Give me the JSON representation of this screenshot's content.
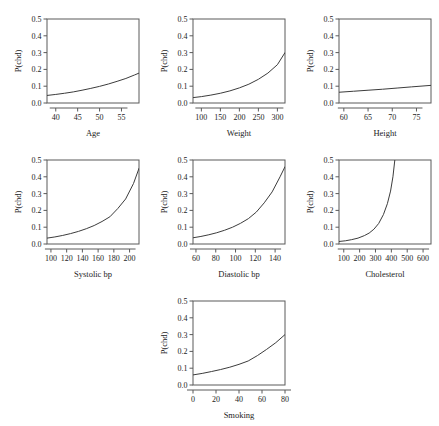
{
  "figure": {
    "background": "#ffffff",
    "line_color": "#3c3c3c",
    "axis_color": "#5a5a5a",
    "ylabel": "P(chd)",
    "yticks": [
      "0.0",
      "0.1",
      "0.2",
      "0.3",
      "0.4",
      "0.5"
    ],
    "ylim": [
      0.0,
      0.5
    ]
  },
  "chart_data": [
    {
      "type": "line",
      "title": "",
      "xlabel": "Age",
      "ylabel": "P(chd)",
      "xlim": [
        38,
        59
      ],
      "ylim": [
        0.0,
        0.5
      ],
      "grid": false,
      "legend": "none",
      "xticks": [
        40,
        45,
        50,
        55
      ],
      "yticks": [
        0.0,
        0.1,
        0.2,
        0.3,
        0.4,
        0.5
      ],
      "x": [
        38,
        40,
        42,
        44,
        46,
        48,
        50,
        52,
        54,
        56,
        58,
        59
      ],
      "y": [
        0.045,
        0.051,
        0.058,
        0.066,
        0.076,
        0.087,
        0.099,
        0.113,
        0.129,
        0.146,
        0.167,
        0.178
      ]
    },
    {
      "type": "line",
      "title": "",
      "xlabel": "Weight",
      "ylabel": "P(chd)",
      "xlim": [
        78,
        320
      ],
      "ylim": [
        0.0,
        0.5
      ],
      "grid": false,
      "legend": "none",
      "xticks": [
        100,
        150,
        200,
        250,
        300
      ],
      "yticks": [
        0.0,
        0.1,
        0.2,
        0.3,
        0.4,
        0.5
      ],
      "x": [
        78,
        100,
        125,
        150,
        175,
        200,
        225,
        250,
        275,
        300,
        320
      ],
      "y": [
        0.032,
        0.038,
        0.047,
        0.058,
        0.072,
        0.09,
        0.112,
        0.141,
        0.178,
        0.228,
        0.3
      ]
    },
    {
      "type": "line",
      "title": "",
      "xlabel": "Height",
      "ylabel": "P(chd)",
      "xlim": [
        59,
        78
      ],
      "ylim": [
        0.0,
        0.5
      ],
      "grid": false,
      "legend": "none",
      "xticks": [
        60,
        65,
        70,
        75
      ],
      "yticks": [
        0.0,
        0.1,
        0.2,
        0.3,
        0.4,
        0.5
      ],
      "x": [
        59,
        62,
        65,
        68,
        71,
        74,
        78
      ],
      "y": [
        0.064,
        0.07,
        0.076,
        0.082,
        0.089,
        0.096,
        0.105
      ]
    },
    {
      "type": "line",
      "title": "",
      "xlabel": "Systolic bp",
      "ylabel": "P(chd)",
      "xlim": [
        95,
        212
      ],
      "ylim": [
        0.0,
        0.5
      ],
      "grid": false,
      "legend": "none",
      "xticks": [
        100,
        120,
        140,
        160,
        180,
        200
      ],
      "yticks": [
        0.0,
        0.1,
        0.2,
        0.3,
        0.4,
        0.5
      ],
      "x": [
        95,
        105,
        115,
        125,
        135,
        145,
        155,
        165,
        175,
        185,
        195,
        205,
        212
      ],
      "y": [
        0.035,
        0.042,
        0.051,
        0.062,
        0.075,
        0.091,
        0.11,
        0.134,
        0.162,
        0.211,
        0.268,
        0.36,
        0.45
      ]
    },
    {
      "type": "line",
      "title": "",
      "xlabel": "Diastolic bp",
      "ylabel": "P(chd)",
      "xlim": [
        57,
        150
      ],
      "ylim": [
        0.0,
        0.5
      ],
      "grid": false,
      "legend": "none",
      "xticks": [
        60,
        80,
        100,
        120,
        140
      ],
      "yticks": [
        0.0,
        0.1,
        0.2,
        0.3,
        0.4,
        0.5
      ],
      "x": [
        57,
        65,
        73,
        81,
        89,
        97,
        105,
        113,
        121,
        129,
        137,
        145,
        150
      ],
      "y": [
        0.037,
        0.045,
        0.055,
        0.067,
        0.082,
        0.1,
        0.123,
        0.151,
        0.19,
        0.245,
        0.31,
        0.4,
        0.46
      ]
    },
    {
      "type": "line",
      "title": "",
      "xlabel": "Cholesterol",
      "ylabel": "P(chd)",
      "xlim": [
        70,
        650
      ],
      "ylim": [
        0.0,
        0.5
      ],
      "grid": false,
      "legend": "none",
      "xticks": [
        100,
        200,
        300,
        400,
        500,
        600
      ],
      "yticks": [
        0.0,
        0.1,
        0.2,
        0.3,
        0.4,
        0.5
      ],
      "x": [
        70,
        110,
        150,
        190,
        230,
        260,
        290,
        320,
        350,
        375,
        395,
        410,
        422
      ],
      "y": [
        0.015,
        0.019,
        0.026,
        0.035,
        0.05,
        0.065,
        0.088,
        0.122,
        0.175,
        0.24,
        0.315,
        0.4,
        0.5
      ]
    },
    {
      "type": "line",
      "title": "",
      "xlabel": "Smoking",
      "ylabel": "P(chd)",
      "xlim": [
        0,
        80
      ],
      "ylim": [
        0.0,
        0.5
      ],
      "grid": false,
      "legend": "none",
      "xticks": [
        0,
        20,
        40,
        60,
        80
      ],
      "yticks": [
        0.0,
        0.1,
        0.2,
        0.3,
        0.4,
        0.5
      ],
      "x": [
        0,
        8,
        16,
        24,
        32,
        40,
        48,
        56,
        64,
        72,
        80
      ],
      "y": [
        0.06,
        0.069,
        0.08,
        0.092,
        0.106,
        0.123,
        0.143,
        0.175,
        0.212,
        0.252,
        0.3
      ]
    }
  ],
  "panels": [
    {
      "name": "age",
      "label": "Age",
      "left": 0,
      "top": 2
    },
    {
      "name": "weight",
      "label": "Weight",
      "left": 146,
      "top": 2
    },
    {
      "name": "height",
      "label": "Height",
      "left": 292,
      "top": 2
    },
    {
      "name": "systolic-bp",
      "label": "Systolic bp",
      "left": 0,
      "top": 143
    },
    {
      "name": "diastolic-bp",
      "label": "Diastolic bp",
      "left": 146,
      "top": 143
    },
    {
      "name": "cholesterol",
      "label": "Cholesterol",
      "left": 292,
      "top": 143
    },
    {
      "name": "smoking",
      "label": "Smoking",
      "left": 146,
      "top": 284
    }
  ]
}
